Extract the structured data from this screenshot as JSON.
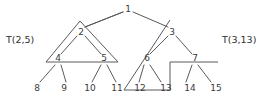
{
  "diagram": {
    "background_color": "#ffffff",
    "line_color": "#5a5a5a",
    "text_color": "#3a3a3a",
    "nodes": [
      {
        "id": "n1",
        "label": "1",
        "x": 128,
        "y": 9,
        "kind": "root"
      },
      {
        "id": "n2",
        "label": "2",
        "x": 81,
        "y": 32,
        "kind": "internal"
      },
      {
        "id": "n3",
        "label": "3",
        "x": 172,
        "y": 32,
        "kind": "internal"
      },
      {
        "id": "n4",
        "label": "4",
        "x": 58,
        "y": 58,
        "kind": "internal"
      },
      {
        "id": "n5",
        "label": "5",
        "x": 104,
        "y": 58,
        "kind": "internal"
      },
      {
        "id": "n6",
        "label": "6",
        "x": 147,
        "y": 58,
        "kind": "internal"
      },
      {
        "id": "n7",
        "label": "7",
        "x": 195,
        "y": 58,
        "kind": "internal"
      }
    ],
    "leaves": [
      {
        "id": "n8",
        "label": "8",
        "x": 37,
        "y": 88
      },
      {
        "id": "n9",
        "label": "9",
        "x": 64,
        "y": 88
      },
      {
        "id": "n10",
        "label": "10",
        "x": 90,
        "y": 88
      },
      {
        "id": "n11",
        "label": "11",
        "x": 117,
        "y": 88
      },
      {
        "id": "n12",
        "label": "12",
        "x": 140,
        "y": 88
      },
      {
        "id": "n13",
        "label": "13",
        "x": 166,
        "y": 88
      },
      {
        "id": "n14",
        "label": "14",
        "x": 190,
        "y": 88
      },
      {
        "id": "n15",
        "label": "15",
        "x": 216,
        "y": 88
      }
    ],
    "subtree_labels": [
      {
        "id": "t-left",
        "label": "T(2,5)",
        "x": 6,
        "y": 40
      },
      {
        "id": "t-right",
        "label": "T(3,13)",
        "x": 222,
        "y": 40
      }
    ],
    "edges": [
      {
        "from": "1",
        "to": "2",
        "x1": 123,
        "y1": 12,
        "x2": 85,
        "y2": 27
      },
      {
        "from": "1",
        "to": "3",
        "x1": 133,
        "y1": 12,
        "x2": 168,
        "y2": 27
      },
      {
        "from": "2",
        "to": "4",
        "x1": 77,
        "y1": 36,
        "x2": 61,
        "y2": 54
      },
      {
        "from": "2",
        "to": "5",
        "x1": 85,
        "y1": 36,
        "x2": 101,
        "y2": 54
      },
      {
        "from": "3",
        "to": "6",
        "x1": 168,
        "y1": 36,
        "x2": 150,
        "y2": 54
      },
      {
        "from": "3",
        "to": "7",
        "x1": 176,
        "y1": 36,
        "x2": 192,
        "y2": 54
      },
      {
        "from": "4",
        "to": "8",
        "x1": 55,
        "y1": 65,
        "x2": 40,
        "y2": 82
      },
      {
        "from": "4",
        "to": "9",
        "x1": 61,
        "y1": 65,
        "x2": 66,
        "y2": 82
      },
      {
        "from": "5",
        "to": "10",
        "x1": 101,
        "y1": 65,
        "x2": 92,
        "y2": 82
      },
      {
        "from": "5",
        "to": "11",
        "x1": 107,
        "y1": 65,
        "x2": 116,
        "y2": 82
      },
      {
        "from": "6",
        "to": "12",
        "x1": 144,
        "y1": 65,
        "x2": 139,
        "y2": 82
      },
      {
        "from": "6",
        "to": "13",
        "x1": 150,
        "y1": 65,
        "x2": 161,
        "y2": 82
      },
      {
        "from": "7",
        "to": "14",
        "x1": 192,
        "y1": 65,
        "x2": 186,
        "y2": 82
      },
      {
        "from": "7",
        "to": "15",
        "x1": 198,
        "y1": 65,
        "x2": 211,
        "y2": 82
      }
    ],
    "regions": [
      {
        "id": "region-left",
        "name": "T(2,5)",
        "points": "80,21 46,62 118,62"
      },
      {
        "id": "region-right",
        "name": "T(3,13)",
        "points": "170,20 124,90 170,90 170,62 218,62"
      }
    ]
  }
}
